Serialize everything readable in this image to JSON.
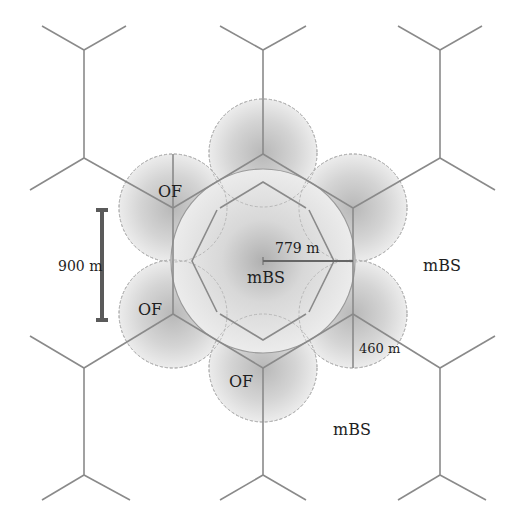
{
  "diagram": {
    "type": "hexagonal-cell-layout",
    "colors": {
      "background": "#ffffff",
      "grid_line": "#8a8a8a",
      "circle_outline": "#a8a8a8",
      "shade_dark": "#b4b4b4",
      "shade_light": "#ebebeb",
      "scale_bar": "#5a5a5a",
      "text": "#1e1e1e"
    },
    "labels": {
      "center_mbs": "mBS",
      "right_mbs": "mBS",
      "bottom_mbs": "mBS",
      "of_upper_left": "OF",
      "of_left": "OF",
      "of_bottom": "OF",
      "radius_label": "779 m",
      "small_radius_label": "460 m",
      "scale_label": "900 m"
    },
    "measurements": {
      "macro_cell_radius_m": 779,
      "offload_cell_radius_m": 460,
      "scale_bar_length_m": 900
    },
    "offload_cells_count": 6
  }
}
